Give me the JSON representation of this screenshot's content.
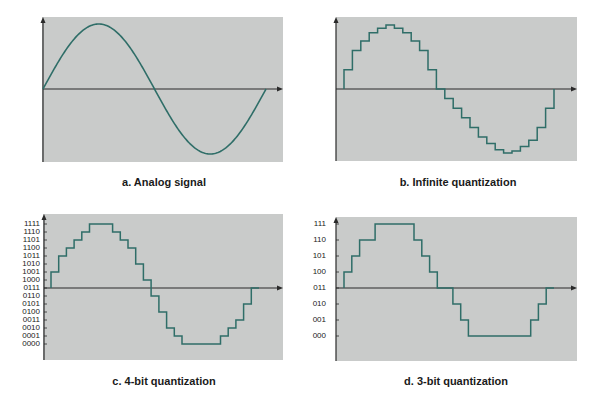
{
  "colors": {
    "plot_bg": "#c9cbca",
    "signal": "#2f6e68",
    "axis": "#2a2a2a",
    "page_bg": "#ffffff"
  },
  "panels": {
    "a": {
      "caption": "a.  Analog signal"
    },
    "b": {
      "caption": "b.  Infinite quantization"
    },
    "c": {
      "caption": "c.  4-bit quantization",
      "levels": [
        "1111",
        "1110",
        "1101",
        "1100",
        "1011",
        "1010",
        "1001",
        "1000",
        "0111",
        "0110",
        "0101",
        "0100",
        "0011",
        "0010",
        "0001",
        "0000"
      ]
    },
    "d": {
      "caption": "d.  3-bit quantization",
      "levels": [
        "111",
        "110",
        "101",
        "100",
        "011",
        "010",
        "001",
        "000"
      ]
    }
  },
  "chart_data": [
    {
      "type": "line",
      "title": "a. Analog signal",
      "xlabel": "",
      "ylabel": "",
      "series": [
        {
          "name": "analog",
          "description": "one full period of a sine wave starting at zero",
          "x": [
            0,
            0.25,
            0.5,
            0.75,
            1.0
          ],
          "values": [
            0,
            1,
            0,
            -1,
            0
          ]
        }
      ],
      "grid": false
    },
    {
      "type": "line",
      "title": "b. Infinite quantization",
      "xlabel": "",
      "ylabel": "",
      "series": [
        {
          "name": "sampled-staircase",
          "description": "sine sampled in ~26 equal time steps, held between samples",
          "values": [
            0.3,
            0.6,
            0.75,
            0.88,
            0.95,
            1.0,
            0.95,
            0.88,
            0.75,
            0.6,
            0.3,
            0,
            -0.15,
            -0.3,
            -0.45,
            -0.6,
            -0.75,
            -0.85,
            -0.95,
            -1.0,
            -0.97,
            -0.9,
            -0.8,
            -0.6,
            -0.3,
            0
          ]
        }
      ],
      "grid": false
    },
    {
      "type": "line",
      "title": "c. 4-bit quantization",
      "xlabel": "",
      "ylabel": "",
      "y_tick_labels": [
        "0000",
        "0001",
        "0010",
        "0011",
        "0100",
        "0101",
        "0110",
        "0111",
        "1000",
        "1001",
        "1010",
        "1011",
        "1100",
        "1101",
        "1110",
        "1111"
      ],
      "series": [
        {
          "name": "4-bit",
          "values_binary": [
            "1001",
            "1011",
            "1100",
            "1101",
            "1110",
            "1111",
            "1111",
            "1111",
            "1110",
            "1101",
            "1100",
            "1010",
            "1000",
            "0110",
            "0100",
            "0010",
            "0001",
            "0000",
            "0000",
            "0000",
            "0000",
            "0000",
            "0001",
            "0010",
            "0011",
            "0101",
            "0111"
          ]
        }
      ],
      "grid": false
    },
    {
      "type": "line",
      "title": "d. 3-bit quantization",
      "xlabel": "",
      "ylabel": "",
      "y_tick_labels": [
        "000",
        "001",
        "010",
        "011",
        "100",
        "101",
        "110",
        "111"
      ],
      "series": [
        {
          "name": "3-bit",
          "values_binary": [
            "100",
            "101",
            "110",
            "110",
            "111",
            "111",
            "111",
            "111",
            "111",
            "110",
            "101",
            "100",
            "011",
            "011",
            "010",
            "001",
            "000",
            "000",
            "000",
            "000",
            "000",
            "000",
            "000",
            "000",
            "001",
            "010",
            "011"
          ]
        }
      ],
      "grid": false
    }
  ]
}
